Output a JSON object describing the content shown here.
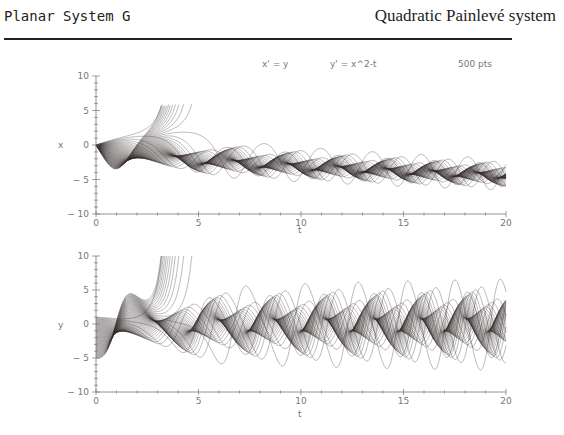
{
  "header": {
    "left_title": "Planar System G",
    "right_title": "Quadratic Painlevé system"
  },
  "chart_data": [
    {
      "type": "line",
      "title": "x' = y      y' = x^2-t",
      "annotation": "500 pts",
      "xlabel": "t",
      "ylabel": "x",
      "xlim": [
        0,
        20
      ],
      "ylim": [
        -10,
        10
      ],
      "xticks": [
        "0",
        "5",
        "10",
        "15",
        "20"
      ],
      "yticks": [
        "10",
        "5",
        "0",
        "-5",
        "-10"
      ],
      "series_description": "Family of solution curves x(t) with x(0)=0, y(0) from about -5 to 1; some curves blow up to +10 near t≈3-4, others oscillate about x≈-sqrt(t)"
    },
    {
      "type": "line",
      "xlabel": "t",
      "ylabel": "y",
      "xlim": [
        0,
        20
      ],
      "ylim": [
        -10,
        10
      ],
      "xticks": [
        "0",
        "5",
        "10",
        "15",
        "20"
      ],
      "yticks": [
        "10",
        "5",
        "0",
        "-5",
        "-10"
      ],
      "series_description": "Family of solution curves y(t) for the same initial conditions"
    }
  ],
  "plot": {
    "equation_x": "x' = y",
    "equation_y": "y' = x^2-t",
    "points": "500 pts",
    "ylabel_top": "x",
    "ylabel_bottom": "y",
    "xlabel": "t"
  }
}
